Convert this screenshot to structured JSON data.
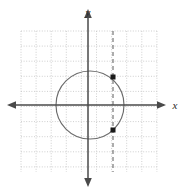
{
  "figure": {
    "title": "",
    "width": 188,
    "height": 191,
    "background_color": "#ffffff"
  },
  "axes": {
    "x_axis": {
      "label": "x",
      "label_position": {
        "x": 175,
        "y": 109
      },
      "color": "#4a4a4a",
      "pixel_y": 105,
      "start_x": 6,
      "end_x": 168,
      "arrow_both_ends": true
    },
    "y_axis": {
      "label": "y",
      "label_position": {
        "x": 88,
        "y": 16
      },
      "color": "#4a4a4a",
      "pixel_x": 88,
      "start_y": 8,
      "end_y": 186,
      "arrow_both_ends": true
    },
    "origin": {
      "x": 88,
      "y": 105
    },
    "unit_pixels": 15.1
  },
  "grid": {
    "visible": true,
    "style": "dotted",
    "color": "#c9c9c9",
    "spacing_px": 15.1,
    "left": 21,
    "right": 157,
    "top": 31,
    "bottom": 172,
    "columns": 9,
    "rows": 9
  },
  "chart_data": {
    "type": "scatter",
    "title": "",
    "xlabel": "x",
    "ylabel": "y",
    "grid": true,
    "legend": "none",
    "xlim": [
      -4.4,
      4.6
    ],
    "ylim": [
      -4.4,
      4.9
    ],
    "shapes": [
      {
        "name": "circle",
        "type": "circle",
        "center": [
          0,
          0
        ],
        "radius": 2.25,
        "stroke": "#6b6b6b",
        "fill": "none",
        "dash": false,
        "center_px": [
          90,
          105
        ],
        "radius_px": 34
      },
      {
        "name": "vertical-line",
        "type": "vertical_line",
        "x": 1.65,
        "stroke": "#6b6b6b",
        "dash": true,
        "dash_pattern": "4 3",
        "x_px": 113,
        "y_top_px": 31,
        "y_bottom_px": 172
      }
    ],
    "points": [
      {
        "name": "upper-intersection",
        "x": 1.65,
        "y": 1.53,
        "x_px": 113,
        "y_px": 77,
        "marker": "square",
        "color": "#1a1a1a",
        "size_px": 5
      },
      {
        "name": "lower-intersection",
        "x": 1.65,
        "y": -1.63,
        "x_px": 113,
        "y_px": 130,
        "marker": "square",
        "color": "#1a1a1a",
        "size_px": 5
      }
    ]
  },
  "colors": {
    "grid": "#c9c9c9",
    "axis": "#4a4a4a",
    "curve": "#6b6b6b",
    "point": "#1a1a1a",
    "background": "#ffffff"
  }
}
